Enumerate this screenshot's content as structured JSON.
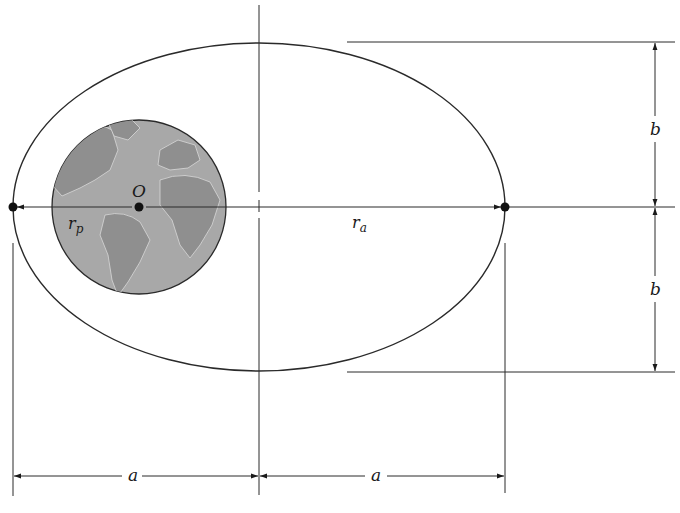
{
  "diagram": {
    "type": "elliptical-orbit-geometry",
    "colors": {
      "line": "#2a2a2a",
      "earth_fill": "#a8a8a8",
      "earth_land": "#8f8f8f",
      "background": "#ffffff"
    },
    "labels": {
      "focus": "O",
      "perigee_radius": "r",
      "perigee_subscript": "p",
      "apogee_radius": "r",
      "apogee_subscript": "a",
      "semi_major_left": "a",
      "semi_major_right": "a",
      "semi_minor_top": "b",
      "semi_minor_bottom": "b"
    },
    "geometry": {
      "ellipse": {
        "cx": 259,
        "cy": 207,
        "rx": 246,
        "ry": 164
      },
      "earth": {
        "cx": 139,
        "cy": 207,
        "r": 87
      },
      "perigee_point": {
        "x": 13,
        "y": 207
      },
      "apogee_point": {
        "x": 505,
        "y": 207
      },
      "focus_point": {
        "x": 139,
        "y": 207
      }
    }
  }
}
